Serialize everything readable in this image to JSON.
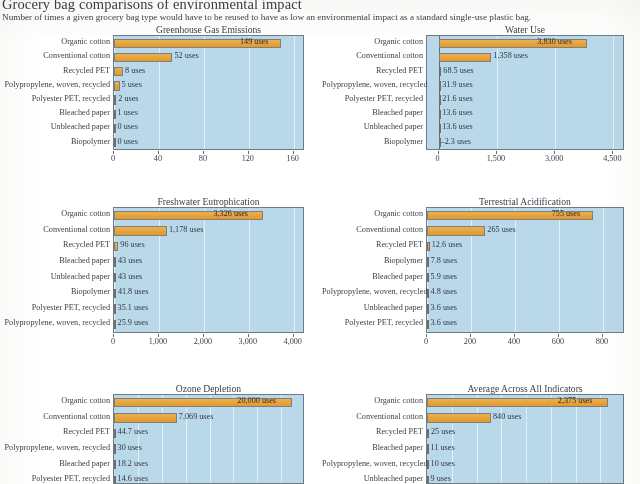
{
  "header": {
    "title": "Grocery bag comparisons of environmental impact",
    "subtitle": "Number of times a given grocery bag type would have to be reused to have as low an environmental impact as a standard single-use plastic bag."
  },
  "colors": {
    "bar": "#e8a23c",
    "bar_border": "#7f7f7f",
    "plot_background": "#b9d9ea",
    "gridline": "#e9f2f8",
    "axis": "#5d6b75",
    "text": "#3a3f45"
  },
  "chart_data": [
    {
      "type": "bar",
      "title": "Greenhouse Gas Emissions",
      "orientation": "horizontal",
      "xlabel": "",
      "ylabel": "",
      "xlim": [
        0,
        170
      ],
      "ticks": [
        0,
        40,
        80,
        120,
        160
      ],
      "tick_labels": [
        "0",
        "40",
        "80",
        "120",
        "160"
      ],
      "grid": true,
      "categories": [
        "Organic cotton",
        "Conventional cotton",
        "Recycled PET",
        "Polypropylene, woven, recycled",
        "Polyester PET, recycled",
        "Bleached paper",
        "Unbleached paper",
        "Biopolymer"
      ],
      "values": [
        149,
        52,
        8,
        5,
        2,
        1,
        0,
        0
      ],
      "value_labels": [
        "149 uses",
        "52 uses",
        "8 uses",
        "5 uses",
        "2 uses",
        "1 uses",
        "0 uses",
        "0 uses"
      ]
    },
    {
      "type": "bar",
      "title": "Water Use",
      "orientation": "horizontal",
      "xlabel": "",
      "ylabel": "",
      "xlim": [
        -300,
        4800
      ],
      "ticks": [
        0,
        1500,
        3000,
        4500
      ],
      "tick_labels": [
        "0",
        "1,500",
        "3,000",
        "4,500"
      ],
      "grid": true,
      "categories": [
        "Organic cotton",
        "Conventional cotton",
        "Recycled PET",
        "Polypropylene, woven, recycled",
        "Polyester PET, recycled",
        "Bleached paper",
        "Unbleached paper",
        "Biopolymer"
      ],
      "values": [
        3830,
        1358,
        68.5,
        31.9,
        21.6,
        13.6,
        13.6,
        -2.3
      ],
      "value_labels": [
        "3,830 uses",
        "1,358 uses",
        "68.5 uses",
        "31.9 uses",
        "21.6 uses",
        "13.6 uses",
        "13.6 uses",
        "–2.3 uses"
      ]
    },
    {
      "type": "bar",
      "title": "Freshwater Eutrophication",
      "orientation": "horizontal",
      "xlabel": "",
      "ylabel": "",
      "xlim": [
        0,
        4250
      ],
      "ticks": [
        0,
        1000,
        2000,
        3000,
        4000
      ],
      "tick_labels": [
        "0",
        "1,000",
        "2,000",
        "3,000",
        "4,000"
      ],
      "grid": true,
      "categories": [
        "Organic cotton",
        "Conventional cotton",
        "Recycled PET",
        "Bleached paper",
        "Unbleached paper",
        "Biopolymer",
        "Polyester PET, recycled",
        "Polypropylene, woven, recycled"
      ],
      "values": [
        3326,
        1178,
        96,
        43,
        43,
        41.8,
        35.1,
        25.9
      ],
      "value_labels": [
        "3,326 uses",
        "1,178 uses",
        "96 uses",
        "43 uses",
        "43 uses",
        "41.8 uses",
        "35.1 uses",
        "25.9 uses"
      ]
    },
    {
      "type": "bar",
      "title": "Terrestrial Acidification",
      "orientation": "horizontal",
      "xlabel": "",
      "ylabel": "",
      "xlim": [
        0,
        900
      ],
      "ticks": [
        0,
        200,
        400,
        600,
        800
      ],
      "tick_labels": [
        "0",
        "200",
        "400",
        "600",
        "800"
      ],
      "grid": true,
      "categories": [
        "Organic cotton",
        "Conventional cotton",
        "Recycled PET",
        "Biopolymer",
        "Bleached paper",
        "Polypropylene, woven, recycled",
        "Unbleached paper",
        "Polyester PET, recycled"
      ],
      "values": [
        755,
        265,
        12.6,
        7.8,
        5.9,
        4.8,
        3.6,
        3.6
      ],
      "value_labels": [
        "755 uses",
        "265 uses",
        "12.6 uses",
        "7.8 uses",
        "5.9 uses",
        "4.8 uses",
        "3.6 uses",
        "3.6 uses"
      ]
    },
    {
      "type": "bar",
      "title": "Ozone Depletion",
      "orientation": "horizontal",
      "xlabel": "",
      "ylabel": "",
      "xlim": [
        0,
        21500
      ],
      "ticks": [],
      "tick_labels": [],
      "grid": true,
      "clipped_at_bottom": true,
      "categories": [
        "Organic cotton",
        "Conventional cotton",
        "Recycled PET",
        "Polypropylene, woven, recycled",
        "Bleached paper",
        "Polyester PET, recycled"
      ],
      "values": [
        20000,
        7069,
        44.7,
        30,
        18.2,
        14.6
      ],
      "value_labels": [
        "20,000 uses",
        "7,069 uses",
        "44.7 uses",
        "30 uses",
        "18.2 uses",
        "14.6 uses"
      ]
    },
    {
      "type": "bar",
      "title": "Average Across All Indicators",
      "orientation": "horizontal",
      "xlabel": "",
      "ylabel": "",
      "xlim": [
        0,
        2600
      ],
      "ticks": [],
      "tick_labels": [],
      "grid": true,
      "clipped_at_bottom": true,
      "categories": [
        "Organic cotton",
        "Conventional cotton",
        "Recycled PET",
        "Bleached paper",
        "Polypropylene, woven, recycled",
        "Unbleached paper"
      ],
      "values": [
        2375,
        840,
        25,
        11,
        10,
        9
      ],
      "value_labels": [
        "2,375 uses",
        "840 uses",
        "25 uses",
        "11 uses",
        "10 uses",
        "9 uses"
      ]
    }
  ]
}
